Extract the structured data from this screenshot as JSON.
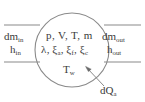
{
  "diagram": {
    "type": "thermodynamic-control-volume",
    "colors": {
      "background": "#ffffff",
      "stroke": "#8a8a8a",
      "text": "#3a3a3a"
    },
    "control_volume": {
      "shape": "circle",
      "center_x": 72,
      "center_y": 50,
      "radius": 37
    },
    "inlet": {
      "dm_symbol": "dm",
      "dm_subscript": "in",
      "h_symbol": "h",
      "h_subscript": "in"
    },
    "outlet": {
      "dm_symbol": "dm",
      "dm_subscript": "out",
      "h_symbol": "h",
      "h_subscript": "out"
    },
    "state_variables": {
      "line1": "p, V, T, m",
      "line2_items": [
        {
          "symbol": "λ",
          "subscript": ""
        },
        {
          "symbol": "ξ",
          "subscript": "a"
        },
        {
          "symbol": "ξ",
          "subscript": "f"
        },
        {
          "symbol": "ξ",
          "subscript": "c"
        }
      ]
    },
    "wall_temperature": {
      "symbol": "T",
      "subscript": "w"
    },
    "heat_flow": {
      "symbol": "dQ",
      "subscript": "a"
    },
    "pipes": {
      "inlet_top_y": 25,
      "inlet_bottom_y": 62,
      "outlet_top_y": 25,
      "outlet_bottom_y": 62
    }
  }
}
